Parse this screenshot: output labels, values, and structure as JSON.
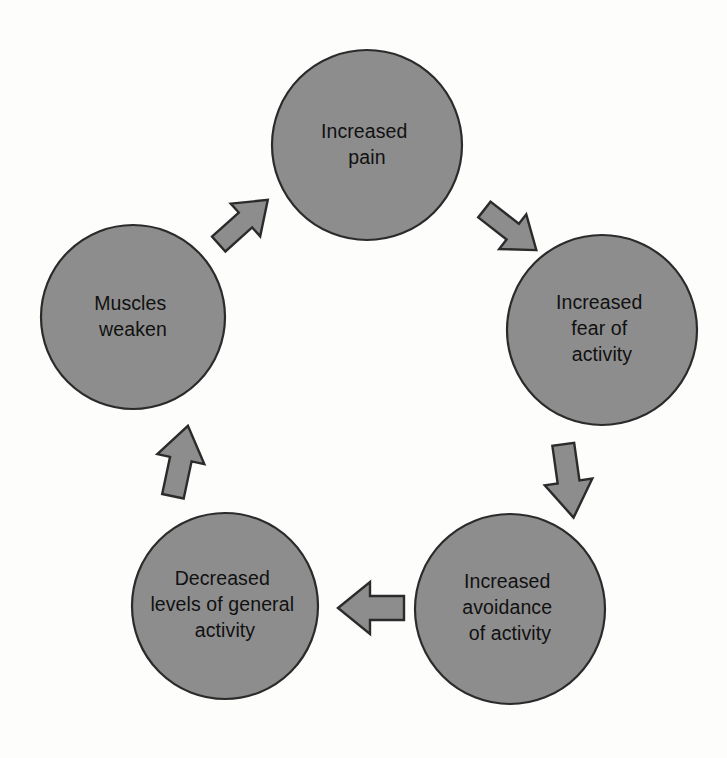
{
  "diagram": {
    "type": "cycle-diagram",
    "background_color": "#fdfdfc",
    "node_fill_color": "#8d8d8d",
    "node_stroke_color": "#2b2b2b",
    "text_color": "#111111",
    "nodes": [
      {
        "id": "increased-pain",
        "lines": [
          "Increased",
          "pain"
        ],
        "cx": 367,
        "cy": 145,
        "r": 95
      },
      {
        "id": "increased-fear-of-activity",
        "lines": [
          "Increased",
          "fear of",
          "activity"
        ],
        "cx": 602,
        "cy": 330,
        "r": 95
      },
      {
        "id": "increased-avoidance-of-activity",
        "lines": [
          "Increased",
          "avoidance",
          "of activity"
        ],
        "cx": 510,
        "cy": 609,
        "r": 95
      },
      {
        "id": "decreased-levels-of-general-activity",
        "lines": [
          "Decreased",
          "levels of general",
          "activity"
        ],
        "cx": 225,
        "cy": 606,
        "r": 93
      },
      {
        "id": "muscles-weaken",
        "lines": [
          "Muscles",
          "weaken"
        ],
        "cx": 133,
        "cy": 317,
        "r": 92
      }
    ],
    "arrows": [
      {
        "id": "arrow-pain-to-fear",
        "from": "increased-pain",
        "to": "increased-fear-of-activity",
        "direction": "down-right",
        "cx": 508,
        "cy": 228,
        "rotation": 128
      },
      {
        "id": "arrow-fear-to-avoidance",
        "from": "increased-fear-of-activity",
        "to": "increased-avoidance-of-activity",
        "direction": "down",
        "cx": 568,
        "cy": 478,
        "rotation": 172
      },
      {
        "id": "arrow-avoidance-to-decreased",
        "from": "increased-avoidance-of-activity",
        "to": "decreased-levels-of-general-activity",
        "direction": "left",
        "cx": 372,
        "cy": 608,
        "rotation": 270
      },
      {
        "id": "arrow-decreased-to-muscles",
        "from": "decreased-levels-of-general-activity",
        "to": "muscles-weaken",
        "direction": "up",
        "cx": 180,
        "cy": 463,
        "rotation": 12
      },
      {
        "id": "arrow-muscles-to-pain",
        "from": "muscles-weaken",
        "to": "increased-pain",
        "direction": "up-right",
        "cx": 241,
        "cy": 224,
        "rotation": 48
      }
    ]
  }
}
